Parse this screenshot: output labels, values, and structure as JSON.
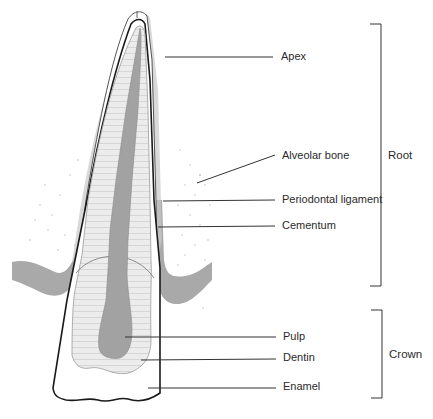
{
  "diagram": {
    "colors": {
      "outline": "#1a1a1a",
      "bone": "#a8a8a8",
      "ligament": "#bdbdbd",
      "dentin": "#e6e6e6",
      "pulp": "#9a9a9a",
      "leader": "#333333"
    },
    "labels": [
      {
        "id": "apex",
        "text": "Apex"
      },
      {
        "id": "alveolar-bone",
        "text": "Alveolar bone"
      },
      {
        "id": "periodontal-ligament",
        "text": "Periodontal ligament"
      },
      {
        "id": "cementum",
        "text": "Cementum"
      },
      {
        "id": "pulp",
        "text": "Pulp"
      },
      {
        "id": "dentin",
        "text": "Dentin"
      },
      {
        "id": "enamel",
        "text": "Enamel"
      }
    ],
    "groups": [
      {
        "id": "root",
        "text": "Root"
      },
      {
        "id": "crown",
        "text": "Crown"
      }
    ]
  }
}
